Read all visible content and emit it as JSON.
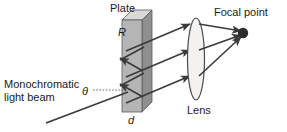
{
  "figure": {
    "type": "optics-diagram",
    "title_visible": false,
    "width": 287,
    "height": 132,
    "background_color": "#ffffff"
  },
  "labels": {
    "plate": "Plate",
    "focal_point": "Focal point",
    "lens": "Lens",
    "plate_thickness": "d",
    "plate_reflectivity": "R",
    "incidence_angle": "θ",
    "beam_line1": "Monochromatic",
    "beam_line2": "light beam"
  },
  "colors": {
    "stroke": "#3a3a3a",
    "text": "#1a1a1a",
    "plate_front": "#b5b5b5",
    "plate_side": "#8f8f8f",
    "plate_top": "#d9d9d9",
    "plate_outline": "#5a5a5a",
    "lens_fill": "#f2f0ee",
    "lens_outline": "#4a4a4a",
    "focal_dot": "#2b2b2b",
    "dotted_guide": "#6a6a6a"
  },
  "geometry": {
    "plate": {
      "front_face": {
        "x": 122,
        "y": 20,
        "width": 20,
        "height": 92
      },
      "depth_x": 10,
      "depth_y": 10
    },
    "lens": {
      "center_x": 196,
      "center_y": 59,
      "rx": 8,
      "ry": 41
    },
    "focal_point": {
      "cx": 243,
      "cy": 33,
      "r": 5
    },
    "incident_beam": {
      "x1": 46,
      "y1": 123,
      "x2": 126,
      "y2": 93
    },
    "theta_guide": {
      "x1": 94,
      "y1": 90,
      "x2": 126,
      "y2": 90
    },
    "reflected_rays": [
      {
        "x1": 122,
        "y1": 88,
        "x2": 188,
        "y2": 65
      },
      {
        "x1": 122,
        "y1": 62,
        "x2": 188,
        "y2": 41
      },
      {
        "x1": 122,
        "y1": 36,
        "x2": 188,
        "y2": 17
      }
    ],
    "internal_zigzag": [
      {
        "x1": 142,
        "y1": 96,
        "x2": 120,
        "y2": 84
      },
      {
        "x1": 120,
        "y1": 84,
        "x2": 142,
        "y2": 72
      },
      {
        "x1": 142,
        "y1": 70,
        "x2": 120,
        "y2": 58
      },
      {
        "x1": 120,
        "y1": 58,
        "x2": 142,
        "y2": 46
      }
    ],
    "converging_rays": [
      {
        "x1": 200,
        "y1": 65,
        "x2": 240,
        "y2": 36
      },
      {
        "x1": 200,
        "y1": 41,
        "x2": 240,
        "y2": 34
      },
      {
        "x1": 200,
        "y1": 17,
        "x2": 240,
        "y2": 31
      }
    ]
  },
  "annotations": {
    "description": "Monochromatic light beam enters a plate of thickness d and reflectivity R at angle theta; multiple reflected parallel rays pass through a lens and converge at the focal point."
  }
}
